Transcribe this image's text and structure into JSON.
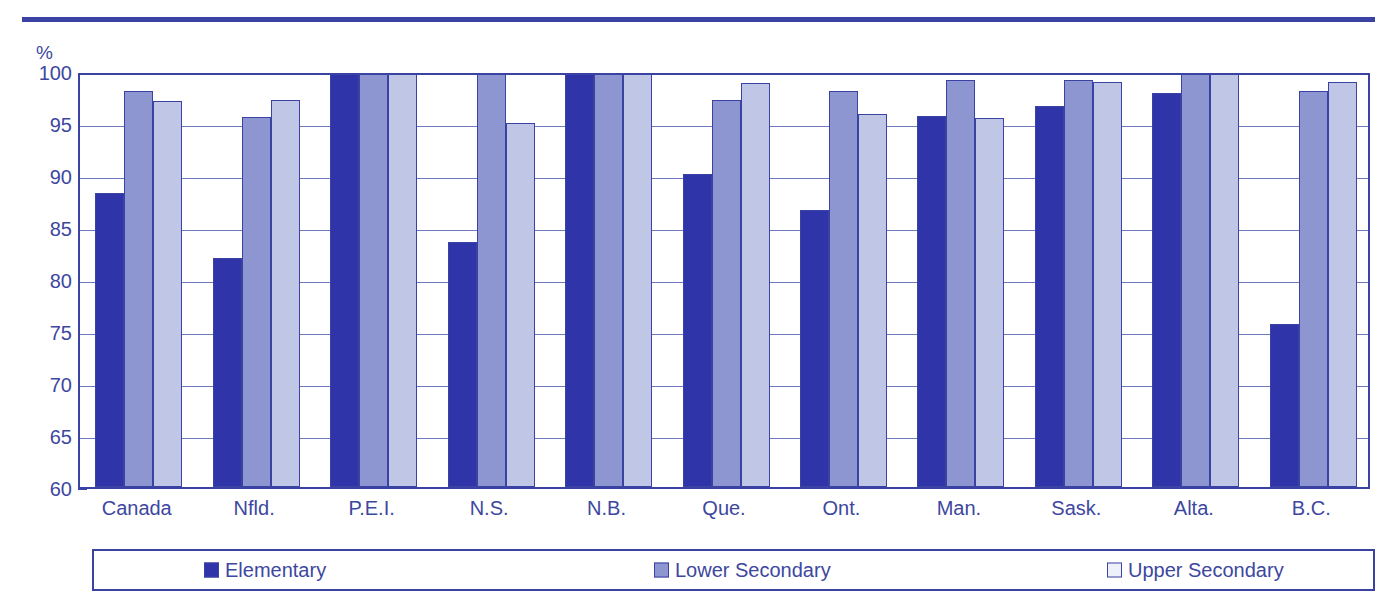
{
  "chart_data": {
    "type": "bar",
    "title": "",
    "subtitle": "",
    "xlabel": "",
    "ylabel": "%",
    "ylim": [
      60,
      100
    ],
    "ytick_step": 5,
    "yticks": [
      60,
      65,
      70,
      75,
      80,
      85,
      90,
      95,
      100
    ],
    "grid": true,
    "legend_position": "bottom",
    "categories": [
      "Canada",
      "Nfld.",
      "P.E.I.",
      "N.S.",
      "N.B.",
      "Que.",
      "Ont.",
      "Man.",
      "Sask.",
      "Alta.",
      "B.C."
    ],
    "series": [
      {
        "name": "Elementary",
        "color": "#2f35a8",
        "values": [
          88.3,
          82.0,
          100.0,
          83.6,
          100.0,
          90.1,
          86.6,
          95.7,
          96.6,
          97.9,
          75.7
        ]
      },
      {
        "name": "Lower  Secondary",
        "color": "#8d96d0",
        "values": [
          98.1,
          95.6,
          100.0,
          100.0,
          100.0,
          97.2,
          98.1,
          99.1,
          99.1,
          99.7,
          98.1
        ]
      },
      {
        "name": "Upper  Secondary",
        "color": "#bfc6e6",
        "values": [
          97.1,
          97.2,
          100.0,
          95.0,
          100.0,
          98.8,
          95.9,
          95.5,
          98.9,
          100.0,
          98.9
        ]
      }
    ]
  },
  "axis": {
    "unit_label": "%"
  },
  "colors": {
    "frame": "#3a42a3",
    "gridline": "#6f7ac0",
    "text": "#3d47a0",
    "series_elementary": "#2f35a8",
    "series_lower_secondary": "#8d96d0",
    "series_upper_secondary": "#bfc6e6"
  }
}
